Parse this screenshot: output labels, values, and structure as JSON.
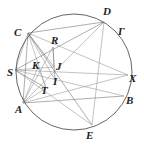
{
  "diagram": {
    "type": "geometry",
    "circle": {
      "label": "Γ",
      "cx": 74,
      "cy": 72,
      "r": 58
    },
    "points": [
      {
        "name": "C",
        "x": 28,
        "y": 33,
        "lx": 14,
        "ly": 36
      },
      {
        "name": "D",
        "x": 104,
        "y": 22,
        "lx": 103,
        "ly": 15
      },
      {
        "name": "X",
        "x": 128,
        "y": 75,
        "lx": 129,
        "ly": 82
      },
      {
        "name": "B",
        "x": 124,
        "y": 96,
        "lx": 126,
        "ly": 104
      },
      {
        "name": "E",
        "x": 92,
        "y": 125,
        "lx": 86,
        "ly": 139
      },
      {
        "name": "A",
        "x": 23,
        "y": 103,
        "lx": 15,
        "ly": 113
      },
      {
        "name": "S",
        "x": 15,
        "y": 70,
        "lx": 7,
        "ly": 76
      },
      {
        "name": "R",
        "x": 53,
        "y": 47,
        "lx": 51,
        "ly": 44
      },
      {
        "name": "K",
        "x": 38,
        "y": 67,
        "lx": 32,
        "ly": 69
      },
      {
        "name": "J",
        "x": 54,
        "y": 67,
        "lx": 56,
        "ly": 70
      },
      {
        "name": "I",
        "x": 55,
        "y": 80,
        "lx": 53,
        "ly": 85
      },
      {
        "name": "T",
        "x": 46,
        "y": 88,
        "lx": 41,
        "ly": 94
      }
    ],
    "circle_label": {
      "text": "Γ",
      "x": 118,
      "y": 35
    },
    "segments": [
      [
        "C",
        "D"
      ],
      [
        "C",
        "X"
      ],
      [
        "C",
        "S"
      ],
      [
        "C",
        "A"
      ],
      [
        "C",
        "T"
      ],
      [
        "C",
        "I"
      ],
      [
        "C",
        "J"
      ],
      [
        "D",
        "E"
      ],
      [
        "D",
        "A"
      ],
      [
        "D",
        "S"
      ],
      [
        "S",
        "X"
      ],
      [
        "S",
        "B"
      ],
      [
        "S",
        "T"
      ],
      [
        "S",
        "J"
      ],
      [
        "A",
        "X"
      ],
      [
        "A",
        "B"
      ],
      [
        "A",
        "T"
      ],
      [
        "A",
        "R"
      ],
      [
        "E",
        "C"
      ],
      [
        "E",
        "S"
      ],
      [
        "R",
        "J"
      ],
      [
        "R",
        "I"
      ],
      [
        "K",
        "T"
      ],
      [
        "K",
        "A"
      ]
    ]
  }
}
